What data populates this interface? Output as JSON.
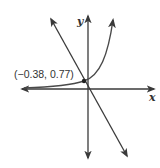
{
  "diagram": {
    "x_axis_label": "x",
    "y_axis_label": "y",
    "intersection_label": "(−0.38, 0.77)",
    "colors": {
      "axis": "#3a3a3a",
      "line": "#3a3a3a",
      "curve": "#4a4a4a",
      "text": "#333333"
    },
    "elements": [
      {
        "type": "line",
        "description": "decreasing straight line through origin region"
      },
      {
        "type": "curve",
        "description": "exponential growth curve"
      },
      {
        "type": "point",
        "label": "(−0.38, 0.77)",
        "x": -0.38,
        "y": 0.77
      }
    ]
  }
}
